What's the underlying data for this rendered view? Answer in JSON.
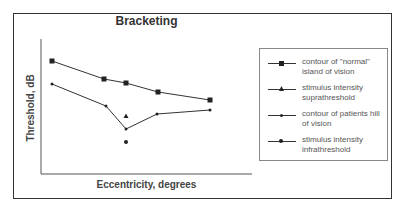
{
  "chart_data": {
    "type": "line",
    "title": "Bracketing",
    "xlabel": "Eccentricity, degrees",
    "ylabel": "Threshold, dB",
    "grid": false,
    "ticks": false,
    "legend_position": "right",
    "series": [
      {
        "name": "contour of \"normal\" island of vision",
        "marker": "square",
        "points": [
          [
            52,
            61
          ],
          [
            104,
            79
          ],
          [
            126,
            83
          ],
          [
            158,
            92
          ],
          [
            210,
            100
          ]
        ]
      },
      {
        "name": "stimulus intensity suprathreshold",
        "marker": "triangle",
        "points": [
          [
            126,
            116
          ]
        ]
      },
      {
        "name": "contour of patients hill of vision",
        "marker": "small-dot",
        "points": [
          [
            52,
            84
          ],
          [
            106,
            106
          ],
          [
            126,
            129
          ],
          [
            157,
            114
          ],
          [
            210,
            110
          ]
        ]
      },
      {
        "name": "stimulus intensity infrathreshold",
        "marker": "circle",
        "points": [
          [
            126,
            142
          ]
        ]
      }
    ],
    "note": "Axes are unlabeled (no tick values); points are given in pixel coordinates of the plot."
  },
  "legend": {
    "items": [
      {
        "line1": "contour of \"normal\"",
        "line2": "island of vision"
      },
      {
        "line1": "stimulus intensity",
        "line2": "suprathreshold"
      },
      {
        "line1": "contour of patients hill",
        "line2": "of vision"
      },
      {
        "line1": "stimulus intensity",
        "line2": "infrathreshold"
      }
    ]
  },
  "colors": {
    "line": "#333333",
    "marker": "#222222",
    "frame": "#333333"
  }
}
